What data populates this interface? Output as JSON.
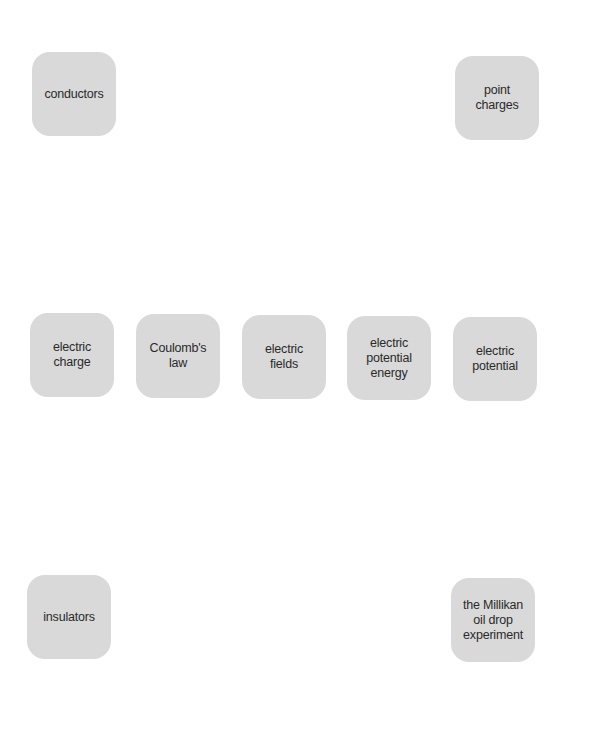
{
  "diagram": {
    "type": "concept-nodes",
    "nodes": [
      {
        "id": "conductors",
        "label": "conductors"
      },
      {
        "id": "point-charges",
        "label": "point\ncharges"
      },
      {
        "id": "electric-charge",
        "label": "electric\ncharge"
      },
      {
        "id": "coulombs-law",
        "label": "Coulomb's\nlaw"
      },
      {
        "id": "electric-fields",
        "label": "electric\nfields"
      },
      {
        "id": "electric-potential-energy",
        "label": "electric\npotential\nenergy"
      },
      {
        "id": "electric-potential",
        "label": "electric\npotential"
      },
      {
        "id": "insulators",
        "label": "insulators"
      },
      {
        "id": "millikan",
        "label": "the Millikan\noil drop\nexperiment"
      }
    ],
    "node_color": "#d9d9d9",
    "text_color": "#2a2a2a"
  }
}
